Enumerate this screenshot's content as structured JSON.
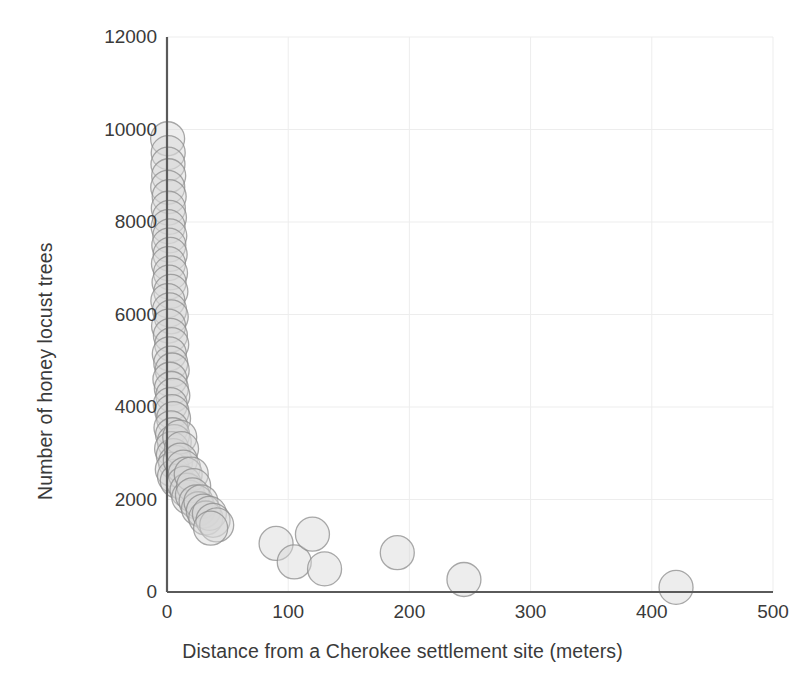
{
  "chart_data": {
    "type": "scatter",
    "title": "",
    "xlabel": "Distance from a Cherokee settlement site (meters)",
    "ylabel": "Number of honey locust trees",
    "xlim": [
      0,
      500
    ],
    "ylim": [
      0,
      12000
    ],
    "xticks": [
      0,
      100,
      200,
      300,
      400,
      500
    ],
    "yticks": [
      0,
      2000,
      4000,
      6000,
      8000,
      10000,
      12000
    ],
    "xtick_labels": [
      "0",
      "100",
      "200",
      "300",
      "400",
      "500"
    ],
    "ytick_labels": [
      "0",
      "2000",
      "4000",
      "6000",
      "8000",
      "10000",
      "12000"
    ],
    "grid": true,
    "grid_color": "#ededed",
    "legend": null,
    "marker": {
      "shape": "circle",
      "radius_px": 17,
      "fill": "#d8d8d8",
      "fill_opacity": 0.45,
      "stroke": "#8c8c8c",
      "stroke_width": 1.3
    },
    "axis_color": "#5a5a5a",
    "text_color": "#3a3a3a",
    "points": [
      {
        "x": 0.5,
        "y": 9800
      },
      {
        "x": 1.0,
        "y": 9500
      },
      {
        "x": 0.8,
        "y": 9250
      },
      {
        "x": 1.4,
        "y": 9000
      },
      {
        "x": 0.6,
        "y": 8750
      },
      {
        "x": 1.8,
        "y": 8550
      },
      {
        "x": 1.1,
        "y": 8300
      },
      {
        "x": 2.0,
        "y": 8100
      },
      {
        "x": 0.9,
        "y": 7900
      },
      {
        "x": 2.3,
        "y": 7700
      },
      {
        "x": 1.5,
        "y": 7500
      },
      {
        "x": 2.6,
        "y": 7300
      },
      {
        "x": 1.2,
        "y": 7100
      },
      {
        "x": 2.9,
        "y": 6900
      },
      {
        "x": 1.7,
        "y": 6700
      },
      {
        "x": 3.2,
        "y": 6500
      },
      {
        "x": 0.7,
        "y": 6300
      },
      {
        "x": 2.1,
        "y": 6100
      },
      {
        "x": 3.5,
        "y": 5950
      },
      {
        "x": 1.3,
        "y": 5750
      },
      {
        "x": 2.8,
        "y": 5550
      },
      {
        "x": 3.9,
        "y": 5350
      },
      {
        "x": 1.9,
        "y": 5150
      },
      {
        "x": 3.1,
        "y": 4950
      },
      {
        "x": 4.3,
        "y": 4800
      },
      {
        "x": 2.4,
        "y": 4600
      },
      {
        "x": 3.6,
        "y": 4400
      },
      {
        "x": 4.8,
        "y": 4250
      },
      {
        "x": 2.7,
        "y": 4050
      },
      {
        "x": 4.1,
        "y": 3900
      },
      {
        "x": 5.4,
        "y": 3750
      },
      {
        "x": 3.3,
        "y": 3550
      },
      {
        "x": 4.6,
        "y": 3400
      },
      {
        "x": 6.0,
        "y": 3250
      },
      {
        "x": 3.8,
        "y": 3100
      },
      {
        "x": 5.2,
        "y": 2950
      },
      {
        "x": 7.0,
        "y": 2800
      },
      {
        "x": 4.4,
        "y": 2650
      },
      {
        "x": 6.2,
        "y": 2500
      },
      {
        "x": 8.5,
        "y": 2400
      },
      {
        "x": 10.5,
        "y": 3350
      },
      {
        "x": 12.0,
        "y": 3100
      },
      {
        "x": 11.0,
        "y": 2850
      },
      {
        "x": 13.5,
        "y": 2700
      },
      {
        "x": 15.0,
        "y": 2550
      },
      {
        "x": 14.0,
        "y": 2350
      },
      {
        "x": 16.5,
        "y": 2200
      },
      {
        "x": 18.0,
        "y": 2050
      },
      {
        "x": 20.0,
        "y": 2550
      },
      {
        "x": 22.0,
        "y": 2300
      },
      {
        "x": 21.0,
        "y": 2100
      },
      {
        "x": 24.0,
        "y": 1950
      },
      {
        "x": 26.0,
        "y": 1800
      },
      {
        "x": 28.0,
        "y": 1950
      },
      {
        "x": 30.0,
        "y": 1750
      },
      {
        "x": 32.0,
        "y": 1600
      },
      {
        "x": 35.0,
        "y": 1700
      },
      {
        "x": 38.0,
        "y": 1550
      },
      {
        "x": 41.0,
        "y": 1450
      },
      {
        "x": 36.0,
        "y": 1380
      },
      {
        "x": 90.0,
        "y": 1050
      },
      {
        "x": 105.0,
        "y": 650
      },
      {
        "x": 120.0,
        "y": 1250
      },
      {
        "x": 130.0,
        "y": 500
      },
      {
        "x": 190.0,
        "y": 850
      },
      {
        "x": 245.0,
        "y": 270
      },
      {
        "x": 420.0,
        "y": 100
      }
    ]
  },
  "figure": {
    "width": 805,
    "height": 679,
    "background": "#ffffff"
  }
}
